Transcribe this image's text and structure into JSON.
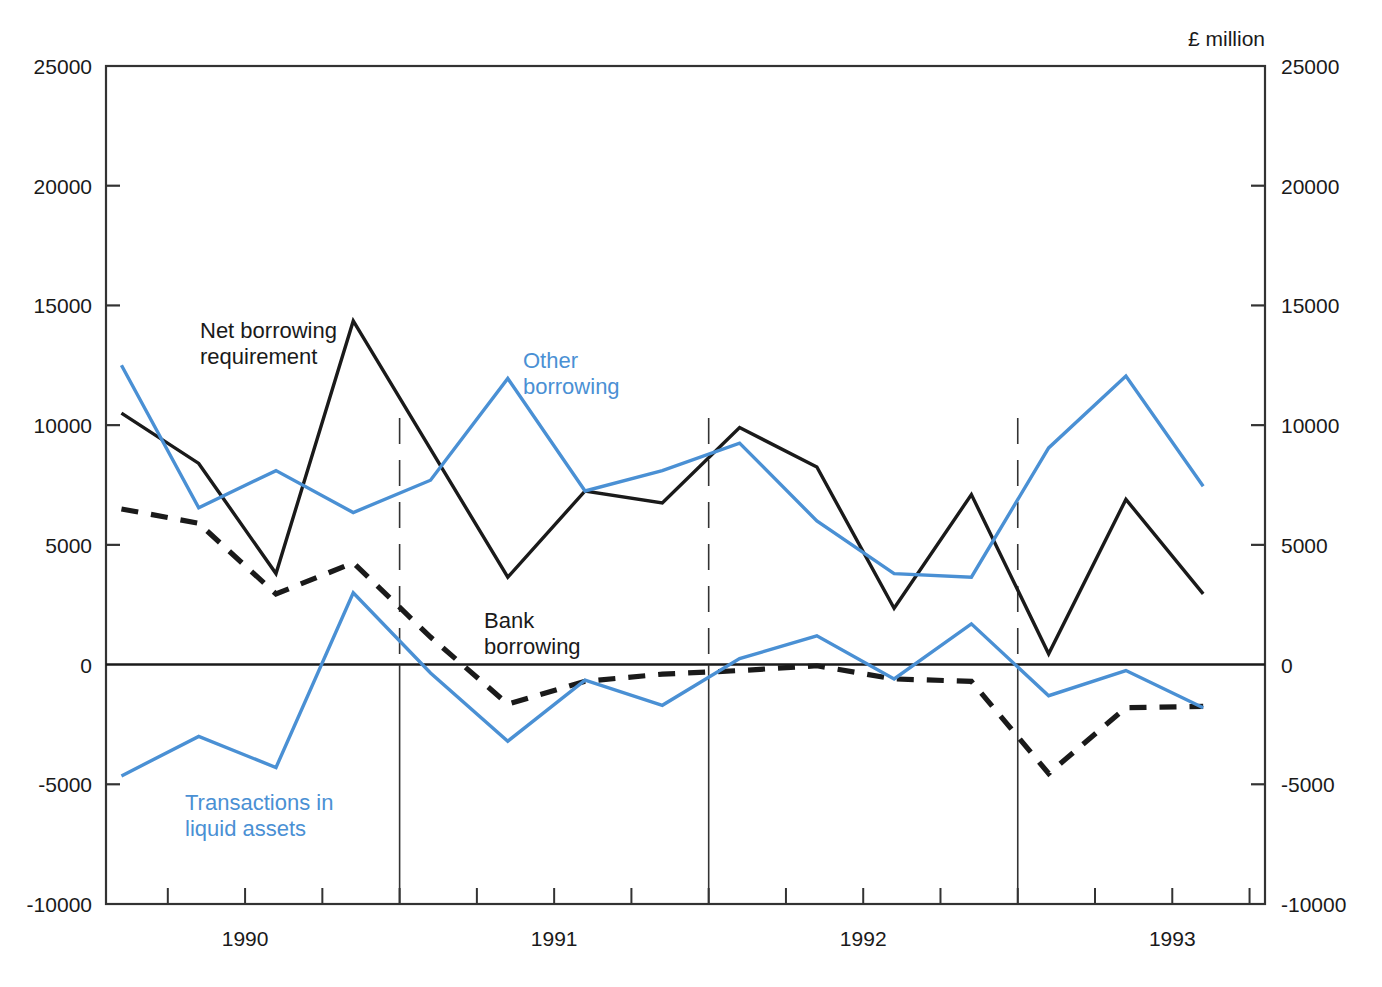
{
  "chart_data": {
    "type": "line",
    "title": "",
    "unit_label": "£ million",
    "xlabel": "",
    "ylabel": "",
    "ylim": [
      -10000,
      25000
    ],
    "ytick_values": [
      25000,
      20000,
      15000,
      10000,
      5000,
      0,
      -5000,
      -10000
    ],
    "ytick_labels_left": [
      "25000",
      "20000",
      "15000",
      "10000",
      "5000",
      "0",
      "-5000",
      "-10000"
    ],
    "ytick_labels_right": [
      "25000",
      "20000",
      "15000",
      "10000",
      "5000",
      "0",
      "-5000",
      "-10000"
    ],
    "grid": false,
    "legend_position": "inline-annotations",
    "x_axis_type": "quarterly",
    "xtick_labels": [
      "1990",
      "1991",
      "1992",
      "1993"
    ],
    "x_year_label_positions": [
      1990.0,
      1991.0,
      1992.0,
      1993.0
    ],
    "x_range": [
      1989.55,
      1993.3
    ],
    "year_boundaries": [
      1990.5,
      1991.5,
      1992.5
    ],
    "x": [
      1989.6,
      1989.85,
      1990.1,
      1990.35,
      1990.6,
      1990.85,
      1991.1,
      1991.35,
      1991.6,
      1991.85,
      1992.1,
      1992.35,
      1992.6,
      1992.85,
      1993.1
    ],
    "series": [
      {
        "name": "Net borrowing requirement",
        "color": "#1a1a1a",
        "style": "solid",
        "label_lines": [
          "Net borrowing",
          "requirement"
        ],
        "values": [
          10500,
          8400,
          3800,
          14350,
          9000,
          3650,
          7250,
          6750,
          9900,
          8250,
          2350,
          7100,
          450,
          6900,
          2950
        ]
      },
      {
        "name": "Other borrowing",
        "color": "#4a90d4",
        "style": "solid",
        "label_lines": [
          "Other",
          "borrowing"
        ],
        "values": [
          12500,
          6550,
          8100,
          6350,
          7700,
          11950,
          7250,
          8100,
          9250,
          6000,
          3800,
          3650,
          9050,
          12050,
          7450
        ]
      },
      {
        "name": "Bank borrowing",
        "color": "#1a1a1a",
        "style": "dashed",
        "label_lines": [
          "Bank",
          "borrowing"
        ],
        "values": [
          6500,
          5900,
          2950,
          4250,
          1150,
          -1650,
          -700,
          -400,
          -250,
          -50,
          -600,
          -700,
          -4550,
          -1800,
          -1750
        ]
      },
      {
        "name": "Transactions in liquid assets",
        "color": "#4a90d4",
        "style": "solid",
        "label_lines": [
          "Transactions in",
          "liquid assets"
        ],
        "values": [
          -4650,
          -3000,
          -4300,
          3000,
          -350,
          -3200,
          -650,
          -1700,
          250,
          1200,
          -600,
          1700,
          -1300,
          -250,
          -1800
        ]
      }
    ],
    "annotations": [
      {
        "id": "net-borrowing-requirement-label",
        "lines": [
          "Net borrowing",
          "requirement"
        ],
        "color": "#1a1a1a",
        "x": 200,
        "y": 338
      },
      {
        "id": "other-borrowing-label",
        "lines": [
          "Other",
          "borrowing"
        ],
        "color": "#4a90d4",
        "x": 523,
        "y": 368
      },
      {
        "id": "bank-borrowing-label",
        "lines": [
          "Bank",
          "borrowing"
        ],
        "color": "#1a1a1a",
        "x": 484,
        "y": 628
      },
      {
        "id": "transactions-in-liquid-assets-label",
        "lines": [
          "Transactions in",
          "liquid assets"
        ],
        "color": "#4a90d4",
        "x": 185,
        "y": 810
      }
    ],
    "colors": {
      "blue": "#4a90d4",
      "black": "#1a1a1a",
      "axis": "#333333",
      "background": "#ffffff"
    }
  }
}
